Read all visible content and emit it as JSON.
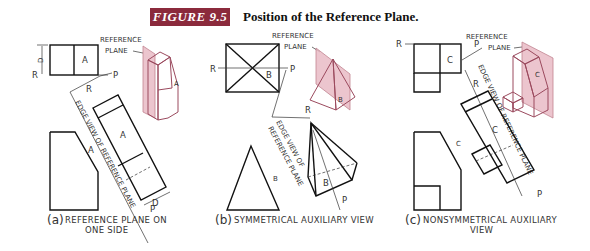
{
  "header": {
    "figure_label": "FIGURE 9.5",
    "figure_title": "Position of the Reference Plane.",
    "badge_color": "#8b2a3c"
  },
  "panels": [
    {
      "id": "a",
      "caption_letter": "(a)",
      "caption_line1": "REFERENCE PLANE ON",
      "caption_line2": "ONE SIDE",
      "labels": {
        "ref_plane_1": "REFERENCE",
        "ref_plane_2": "PLANE",
        "surface": "A",
        "surface_iso": "A",
        "surface_aux": "A",
        "surface_side": "A",
        "r_top": "R",
        "r_aux": "R",
        "p_top": "P",
        "p_aux": "P",
        "depth_top": "D",
        "depth_aux": "D",
        "edge_view": "EDGE VIEW OF REFERENCE PLANE"
      }
    },
    {
      "id": "b",
      "caption_letter": "(b)",
      "caption_line1": "SYMMETRICAL AUXILIARY VIEW",
      "labels": {
        "ref_plane_1": "REFERENCE",
        "ref_plane_2": "PLANE",
        "surface": "B",
        "surface_iso": "B",
        "surface_aux": "B",
        "surface_side": "B",
        "r_top": "R",
        "r_aux": "R",
        "p_top": "P",
        "p_aux": "P",
        "edge_view_1": "EDGE VIEW OF",
        "edge_view_2": "REFERENCE PLANE"
      }
    },
    {
      "id": "c",
      "caption_letter": "(c)",
      "caption_line1": "NONSYMMETRICAL AUXILIARY",
      "caption_line2": "VIEW",
      "labels": {
        "ref_plane_1": "REFERENCE",
        "ref_plane_2": "PLANE",
        "surface": "C",
        "surface_iso": "C",
        "surface_aux": "C",
        "surface_side": "C",
        "r_top": "R",
        "r_aux": "R",
        "p_top": "P",
        "p_aux": "P",
        "edge_view": "EDGE VIEW OF REFERENCE PLANE"
      }
    }
  ]
}
